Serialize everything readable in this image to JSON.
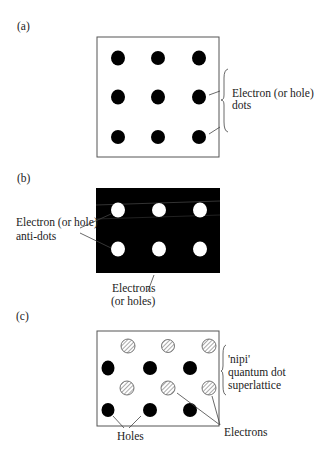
{
  "panels": [
    {
      "label": "(a)",
      "annotation": [
        "Electron (or hole)",
        "dots"
      ],
      "box": {
        "x": 97,
        "y": 37,
        "w": 122,
        "h": 120,
        "fill": "#ffffff"
      },
      "dots": {
        "style": "solid",
        "xs": [
          118,
          158,
          199
        ],
        "ys": [
          58,
          97,
          137
        ]
      }
    },
    {
      "label": "(b)",
      "annotation": [
        "Electron (or hole)",
        "anti-dots"
      ],
      "bottom_annotation": [
        "Electrons",
        "(or holes)"
      ],
      "box": {
        "x": 96,
        "y": 188,
        "w": 124,
        "h": 85,
        "fill": "#000000"
      },
      "dots": {
        "style": "white",
        "xs": [
          118,
          159,
          200
        ],
        "ys": [
          210,
          249
        ]
      }
    },
    {
      "label": "(c)",
      "annotation": [
        "'nipi'",
        "quantum dot",
        "superlattice"
      ],
      "holes_label": "Holes",
      "electrons_label": "Electrons",
      "box": {
        "x": 97,
        "y": 331,
        "w": 122,
        "h": 95,
        "fill": "#ffffff"
      }
    }
  ]
}
